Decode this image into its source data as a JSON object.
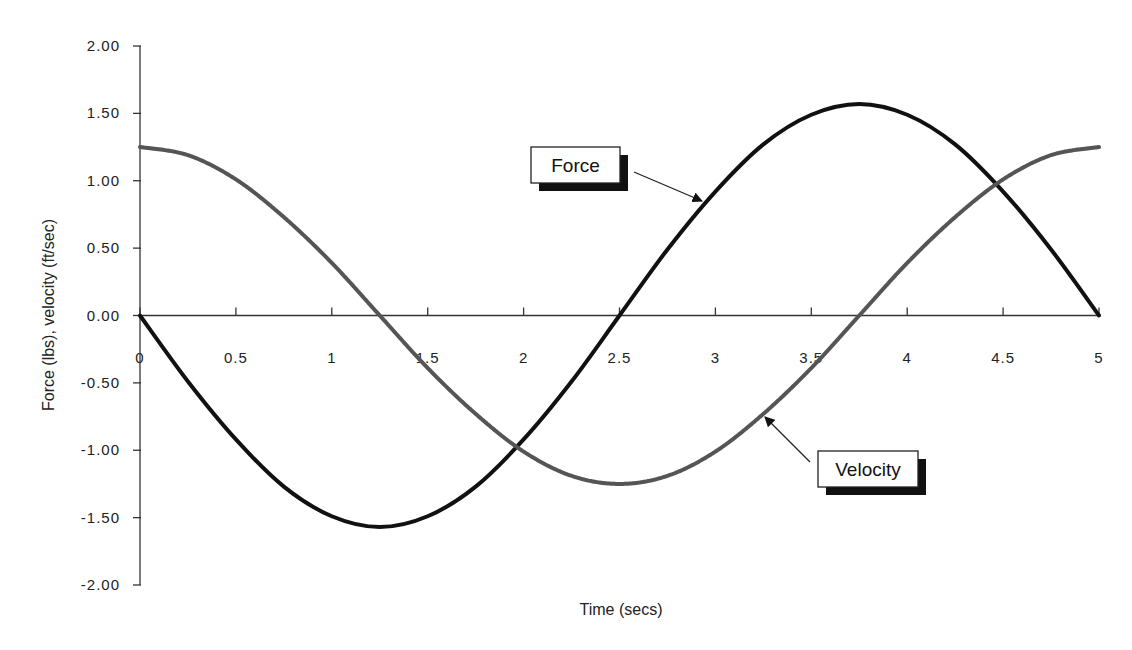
{
  "chart_data": {
    "type": "line",
    "title": "",
    "xlabel": "Time (secs)",
    "ylabel": "Force (lbs), velocity (ft/sec)",
    "xlim": [
      0,
      5
    ],
    "ylim": [
      -2.0,
      2.0
    ],
    "grid": false,
    "legend_position": "callouts",
    "x_ticks": [
      "0",
      "0.5",
      "1",
      "1.5",
      "2",
      "2.5",
      "3",
      "3.5",
      "4",
      "4.5",
      "5"
    ],
    "y_ticks": [
      "2.00",
      "1.50",
      "1.00",
      "0.50",
      "0.00",
      "-0.50",
      "-1.00",
      "-1.50",
      "-2.00"
    ],
    "x": [
      0,
      0.25,
      0.5,
      0.75,
      1.0,
      1.25,
      1.5,
      1.75,
      2.0,
      2.25,
      2.5,
      2.75,
      3.0,
      3.25,
      3.5,
      3.75,
      4.0,
      4.25,
      4.5,
      4.75,
      5.0
    ],
    "series": [
      {
        "name": "Force",
        "color": "#111111",
        "values": [
          0.0,
          -0.49,
          -0.92,
          -1.27,
          -1.49,
          -1.57,
          -1.49,
          -1.27,
          -0.92,
          -0.49,
          0.0,
          0.49,
          0.92,
          1.27,
          1.49,
          1.57,
          1.49,
          1.27,
          0.92,
          0.49,
          0.0
        ]
      },
      {
        "name": "Velocity",
        "color": "#555555",
        "values": [
          1.25,
          1.19,
          1.01,
          0.73,
          0.39,
          0.0,
          -0.39,
          -0.73,
          -1.01,
          -1.19,
          -1.25,
          -1.19,
          -1.01,
          -0.73,
          -0.39,
          0.0,
          0.39,
          0.73,
          1.01,
          1.19,
          1.25
        ]
      }
    ],
    "annotations": [
      {
        "text": "Force",
        "series": "Force",
        "box": [
          531,
          147,
          89,
          36
        ],
        "arrow_from": [
          634,
          172
        ],
        "arrow_to": [
          702,
          201
        ]
      },
      {
        "text": "Velocity",
        "series": "Velocity",
        "box": [
          818,
          451,
          100,
          36
        ],
        "arrow_from": [
          810,
          462
        ],
        "arrow_to": [
          765,
          417
        ]
      }
    ]
  },
  "layout": {
    "x0_px": 140,
    "x5_px": 1099,
    "ytop_px": 46,
    "ybot_px": 585
  }
}
